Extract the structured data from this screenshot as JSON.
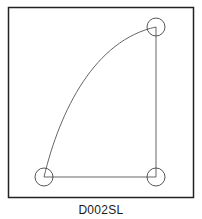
{
  "figure": {
    "label": "D002SL",
    "colors": {
      "frame": "#222222",
      "line": "#555555",
      "circle": "#444444"
    },
    "points": [
      {
        "name": "bottom-left",
        "x": 44,
        "y": 177
      },
      {
        "name": "bottom-right",
        "x": 156,
        "y": 177
      },
      {
        "name": "top-right",
        "x": 156,
        "y": 27
      }
    ],
    "circle_radius": 9
  }
}
